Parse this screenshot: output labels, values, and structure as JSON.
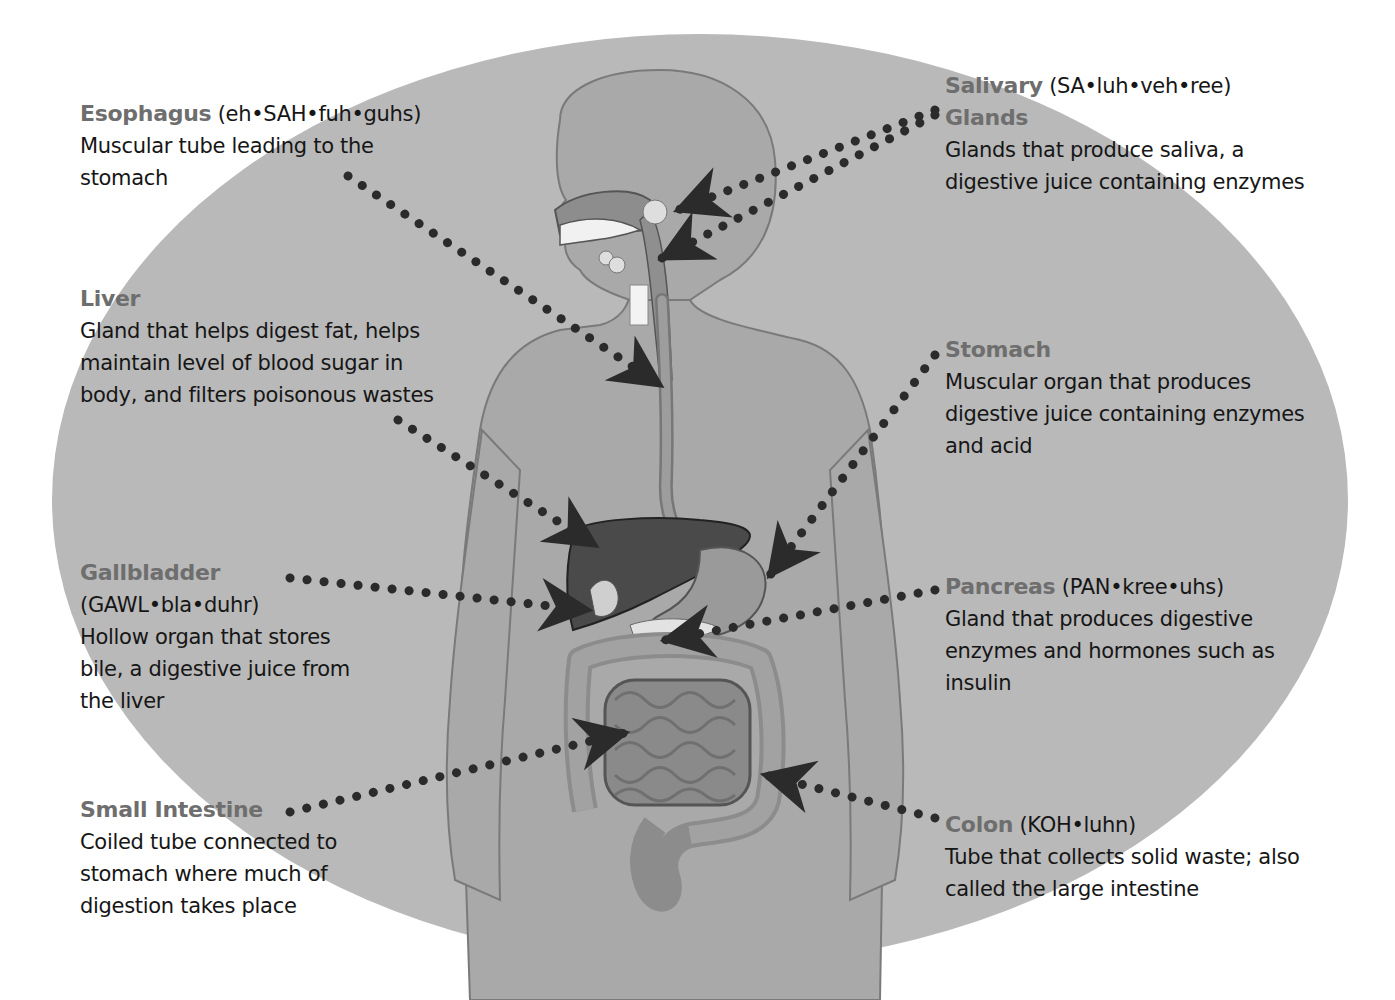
{
  "diagram": {
    "colors": {
      "background": "#ffffff",
      "ellipse": "#b9b9b9",
      "body": "#a9a9a9",
      "body_outline": "#7a7a7a",
      "organ_dark": "#4a4a4a",
      "term": "#6e6e6e",
      "text": "#161616",
      "pointer": "#2b2b2b"
    },
    "labels": {
      "esophagus": {
        "term": "Esophagus",
        "pronunciation": "(eh•SAH•fuh•guhs)",
        "description": "Muscular tube leading to the stomach"
      },
      "salivary_glands": {
        "term_line1": "Salivary",
        "pronunciation": "(SA•luh•veh•ree)",
        "term_line2": "Glands",
        "description": "Glands that produce saliva, a digestive juice containing enzymes"
      },
      "liver": {
        "term": "Liver",
        "description": "Gland that helps digest fat, helps maintain level of blood sugar in body, and filters poisonous wastes"
      },
      "stomach": {
        "term": "Stomach",
        "description": "Muscular organ that produces digestive juice containing enzymes and acid"
      },
      "gallbladder": {
        "term": "Gallbladder",
        "pronunciation": "(GAWL•bla•duhr)",
        "description": "Hollow organ that stores bile, a digestive juice from the liver"
      },
      "pancreas": {
        "term": "Pancreas",
        "pronunciation": "(PAN•kree•uhs)",
        "description": "Gland that produces digestive enzymes and hormones such as insulin"
      },
      "small_intestine": {
        "term": "Small Intestine",
        "description": "Coiled tube connected to stomach where much of digestion takes place"
      },
      "colon": {
        "term": "Colon",
        "pronunciation": "(KOH•luhn)",
        "description": "Tube that collects solid waste; also called the large intestine"
      }
    }
  }
}
